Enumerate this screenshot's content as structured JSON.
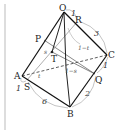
{
  "diagram": {
    "type": "geometry-pyramid",
    "points": {
      "O": {
        "label": "O",
        "x": 64,
        "y": 12
      },
      "R": {
        "label": "R",
        "x": 77,
        "y": 22
      },
      "C": {
        "label": "C",
        "x": 107,
        "y": 55
      },
      "P": {
        "label": "P",
        "x": 44,
        "y": 40
      },
      "T": {
        "label": "T",
        "x": 52,
        "y": 52
      },
      "A": {
        "label": "A",
        "x": 22,
        "y": 76
      },
      "S": {
        "label": "S",
        "x": 27,
        "y": 80
      },
      "Q": {
        "label": "Q",
        "x": 95,
        "y": 74
      },
      "B": {
        "label": "B",
        "x": 70,
        "y": 107
      }
    },
    "edge_labels": {
      "OR": "1",
      "RC": "3",
      "CQ": "1",
      "QB": "2",
      "BS": "6",
      "SA": "1",
      "PT": "s",
      "TS_t": "t",
      "center_1_s": "1−s",
      "center_1_t": "1−t"
    }
  }
}
